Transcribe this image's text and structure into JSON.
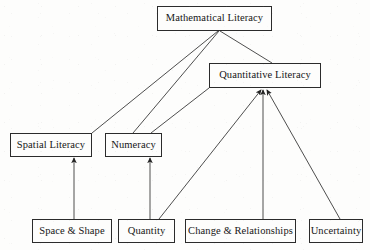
{
  "diagram": {
    "type": "hierarchy-diagram",
    "colors": {
      "background": "#fdfdfc",
      "node_border": "#2b2b2b",
      "node_fill": "#fdfdfc",
      "edge": "#3a3a3a",
      "text": "#161616"
    },
    "nodes": [
      {
        "id": "mathematical-literacy",
        "label": "Mathematical Literacy",
        "x": 157,
        "y": 6,
        "w": 115,
        "h": 25,
        "font_size": 10.5,
        "level": 0
      },
      {
        "id": "quantitative-literacy",
        "label": "Quantitative Literacy",
        "x": 209,
        "y": 63,
        "w": 112,
        "h": 25,
        "font_size": 10.5,
        "level": 1
      },
      {
        "id": "spatial-literacy",
        "label": "Spatial Literacy",
        "x": 10,
        "y": 133,
        "w": 82,
        "h": 24,
        "font_size": 10.5,
        "level": 2
      },
      {
        "id": "numeracy",
        "label": "Numeracy",
        "x": 105,
        "y": 133,
        "w": 57,
        "h": 24,
        "font_size": 10.5,
        "level": 2
      },
      {
        "id": "space-and-shape",
        "label": "Space & Shape",
        "x": 32,
        "y": 219,
        "w": 80,
        "h": 24,
        "font_size": 10.5,
        "level": 3
      },
      {
        "id": "quantity",
        "label": "Quantity",
        "x": 118,
        "y": 219,
        "w": 57,
        "h": 24,
        "font_size": 10.5,
        "level": 3
      },
      {
        "id": "change-and-relationships",
        "label": "Change & Relationships",
        "x": 185,
        "y": 219,
        "w": 111,
        "h": 24,
        "font_size": 10.5,
        "level": 3
      },
      {
        "id": "uncertainty",
        "label": "Uncertainty",
        "x": 309,
        "y": 219,
        "w": 54,
        "h": 24,
        "font_size": 10.5,
        "level": 3
      }
    ],
    "edges": [
      {
        "id": "edge-math-to-spatial",
        "from": "mathematical-literacy",
        "to": "spatial-literacy",
        "x1": 218,
        "y1": 31,
        "x2": 92,
        "y2": 133,
        "arrow": false
      },
      {
        "id": "edge-math-to-numeracy",
        "from": "mathematical-literacy",
        "to": "numeracy",
        "x1": 219,
        "y1": 31,
        "x2": 133,
        "y2": 133,
        "arrow": false
      },
      {
        "id": "edge-math-to-quantitative",
        "from": "mathematical-literacy",
        "to": "quantitative-literacy",
        "x1": 220,
        "y1": 31,
        "x2": 272,
        "y2": 63,
        "arrow": false
      },
      {
        "id": "edge-quantitative-to-numeracy",
        "from": "quantitative-literacy",
        "to": "numeracy",
        "x1": 209,
        "y1": 88,
        "x2": 151,
        "y2": 133,
        "arrow": false
      },
      {
        "id": "edge-space-to-spatial",
        "from": "space-and-shape",
        "to": "spatial-literacy",
        "x1": 74,
        "y1": 219,
        "x2": 74,
        "y2": 158,
        "arrow": true
      },
      {
        "id": "edge-quantity-to-numeracy",
        "from": "quantity",
        "to": "numeracy",
        "x1": 150,
        "y1": 219,
        "x2": 150,
        "y2": 158,
        "arrow": true
      },
      {
        "id": "edge-quantity-to-quantitative",
        "from": "quantity",
        "to": "quantitative-literacy",
        "x1": 159,
        "y1": 219,
        "x2": 261,
        "y2": 90,
        "arrow": true
      },
      {
        "id": "edge-change-to-quantitative",
        "from": "change-and-relationships",
        "to": "quantitative-literacy",
        "x1": 263,
        "y1": 219,
        "x2": 263,
        "y2": 90,
        "arrow": true
      },
      {
        "id": "edge-uncertainty-to-quantitative",
        "from": "uncertainty",
        "to": "quantitative-literacy",
        "x1": 340,
        "y1": 219,
        "x2": 267,
        "y2": 90,
        "arrow": true
      }
    ]
  }
}
